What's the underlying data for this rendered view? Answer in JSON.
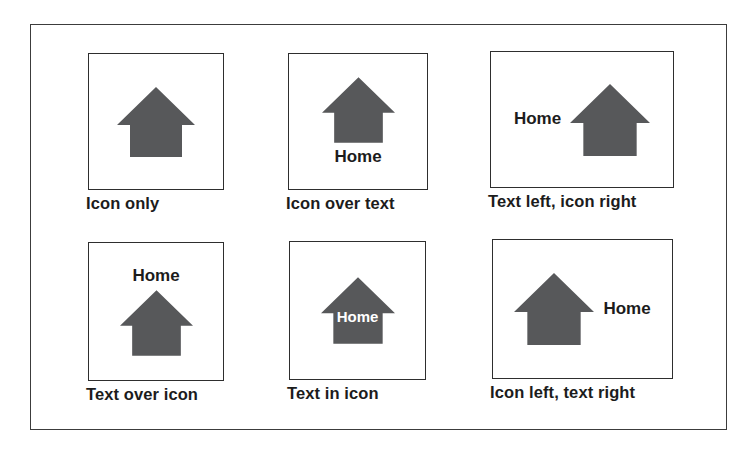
{
  "figure": {
    "background": "#ffffff",
    "frame_border_color": "#3c3c3c",
    "box_border_color": "#2e2e2e",
    "icon_color": "#57585a",
    "text_color": "#1c1c1c",
    "in_icon_label_color": "#ffffff",
    "icon_name": "home-icon",
    "cells": [
      {
        "layout": "icon-only",
        "caption": "Icon only",
        "label": ""
      },
      {
        "layout": "icon-over-text",
        "caption": "Icon over text",
        "label": "Home"
      },
      {
        "layout": "text-left-icon-right",
        "caption": "Text left, icon right",
        "label": "Home"
      },
      {
        "layout": "text-over-icon",
        "caption": "Text over icon",
        "label": "Home"
      },
      {
        "layout": "text-in-icon",
        "caption": "Text in icon",
        "label": "Home"
      },
      {
        "layout": "icon-left-text-right",
        "caption": "Icon left, text right",
        "label": "Home"
      }
    ]
  }
}
